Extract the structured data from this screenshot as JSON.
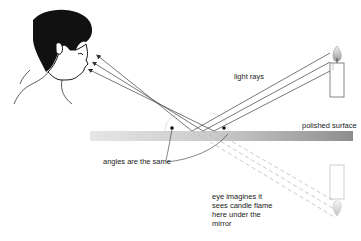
{
  "diagram": {
    "labels": {
      "light_rays": "light rays",
      "polished_surface": "polished surface",
      "angles_same": "angles are the same",
      "eye_imagines": "eye imagines it\nsees candle flame\nhere under the\nmirror"
    },
    "elements": {
      "observer": "boy looking toward mirror",
      "candle": "lit candle",
      "virtual_candle": "reflected image of candle under the mirror",
      "mirror": "polished surface"
    },
    "colors": {
      "ray": "#555555",
      "virtual_ray": "#bbbbbb",
      "mirror_light": "#e0e0e0",
      "mirror_dark": "#9a9a9a",
      "ink": "#222222"
    }
  }
}
